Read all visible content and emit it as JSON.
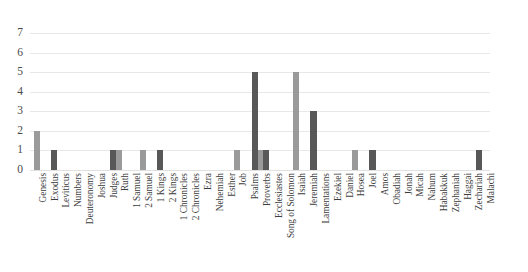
{
  "chart_data": {
    "type": "bar",
    "title": "",
    "subtitle": "",
    "xlabel": "",
    "ylabel": "",
    "ylim": [
      0,
      7
    ],
    "yticks": [
      0,
      1,
      2,
      3,
      4,
      5,
      6,
      7
    ],
    "grid": true,
    "legend": "none",
    "orientation": "vertical",
    "bar_mode": "grouped-by-category",
    "categories": [
      "Genesis",
      "Exodus",
      "Leviticus",
      "Numbers",
      "Deuteronomy",
      "Joshua",
      "Judges",
      "Ruth",
      "1 Samuel",
      "2 Samuel",
      "1 Kings",
      "2 Kings",
      "1 Chronicles",
      "2 Chronicles",
      "Ezra",
      "Nehemiah",
      "Esther",
      "Job",
      "Psalms",
      "Proverbs",
      "Ecclesiastes",
      "Song of Solomon",
      "Isaiah",
      "Jeremiah",
      "Lamentations",
      "Ezekiel",
      "Daniel",
      "Hosea",
      "Joel",
      "Amos",
      "Obadiah",
      "Jonah",
      "Micah",
      "Nahum",
      "Habakkuk",
      "Zephaniah",
      "Haggai",
      "Zechariah",
      "Malachi"
    ],
    "series": [
      {
        "name": "series-light",
        "color": "#9a9a9a",
        "values": [
          2,
          0,
          0,
          0,
          0,
          0,
          0,
          1,
          0,
          1,
          0,
          0,
          0,
          0,
          0,
          0,
          0,
          1,
          0,
          1,
          0,
          0,
          5,
          0,
          0,
          0,
          0,
          1,
          0,
          0,
          0,
          0,
          0,
          0,
          0,
          0,
          0,
          0,
          0
        ]
      },
      {
        "name": "series-dark",
        "color": "#585858",
        "values": [
          0,
          1,
          0,
          0,
          0,
          0,
          1,
          0,
          0,
          0,
          1,
          0,
          0,
          0,
          0,
          0,
          0,
          0,
          5,
          1,
          0,
          0,
          0,
          3,
          0,
          0,
          0,
          0,
          1,
          0,
          0,
          0,
          0,
          0,
          0,
          0,
          0,
          1,
          0
        ]
      }
    ],
    "colors": {
      "light_bar": "#9a9a9a",
      "dark_bar": "#585858",
      "gridline": "#e8e8e8",
      "axis_text": "#4a4a4a",
      "label_text": "#3c3c3c",
      "background": "#ffffff"
    }
  }
}
